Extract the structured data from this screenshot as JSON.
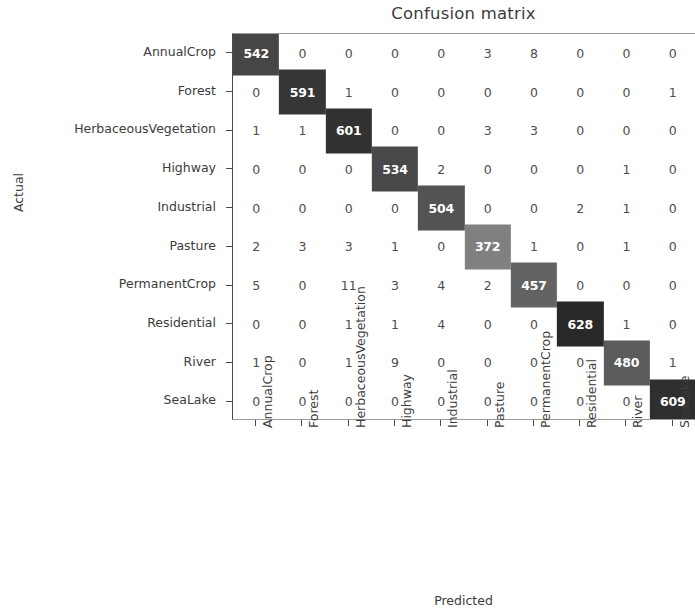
{
  "chart_data": {
    "type": "heatmap",
    "title": "Confusion matrix",
    "xlabel": "Predicted",
    "ylabel": "Actual",
    "categories": [
      "AnnualCrop",
      "Forest",
      "HerbaceousVegetation",
      "Highway",
      "Industrial",
      "Pasture",
      "PermanentCrop",
      "Residential",
      "River",
      "SeaLake"
    ],
    "x_tick_labels": [
      "AnnualCrop",
      "Forest",
      "HerbaceousVegetation",
      "Highway",
      "Industrial",
      "Pasture",
      "PermanentCrop",
      "Residential",
      "River",
      "SeaLake"
    ],
    "y_tick_labels": [
      "AnnualCrop",
      "Forest",
      "HerbaceousVegetation",
      "Highway",
      "Industrial",
      "Pasture",
      "PermanentCrop",
      "Residential",
      "River",
      "SeaLake"
    ],
    "colormap": "greys_reversed",
    "grid": false,
    "legend": "none",
    "vmin": 0,
    "vmax": 628,
    "matrix": [
      [
        542,
        0,
        0,
        0,
        0,
        3,
        8,
        0,
        0,
        0
      ],
      [
        0,
        591,
        1,
        0,
        0,
        0,
        0,
        0,
        0,
        1
      ],
      [
        1,
        1,
        601,
        0,
        0,
        3,
        3,
        0,
        0,
        0
      ],
      [
        0,
        0,
        0,
        534,
        2,
        0,
        0,
        0,
        1,
        0
      ],
      [
        0,
        0,
        0,
        0,
        504,
        0,
        0,
        2,
        1,
        0
      ],
      [
        2,
        3,
        3,
        1,
        0,
        372,
        1,
        0,
        1,
        0
      ],
      [
        5,
        0,
        11,
        3,
        4,
        2,
        457,
        0,
        0,
        0
      ],
      [
        0,
        0,
        1,
        1,
        4,
        0,
        0,
        628,
        1,
        0
      ],
      [
        1,
        0,
        1,
        9,
        0,
        0,
        0,
        0,
        480,
        1
      ],
      [
        0,
        0,
        0,
        0,
        0,
        0,
        0,
        0,
        0,
        609
      ]
    ]
  }
}
